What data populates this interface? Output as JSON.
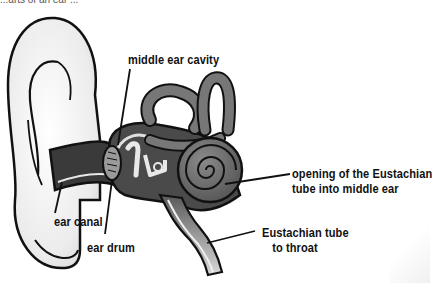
{
  "diagram": {
    "title_fragment": "...arts of an ear ...",
    "labels": [
      {
        "id": "middle-ear-cavity",
        "text": "middle ear cavity"
      },
      {
        "id": "eustachian-opening",
        "line1": "opening of the Eustachian",
        "line2": "tube into middle ear"
      },
      {
        "id": "ear-canal",
        "text": "ear canal"
      },
      {
        "id": "ear-drum",
        "text": "ear drum"
      },
      {
        "id": "eustachian-tube",
        "line1": "Eustachian tube",
        "line2": "to throat"
      }
    ],
    "colors": {
      "outline": "#111111",
      "inner_ear": "#6b6b6b",
      "canal_dark": "#3a3a3a",
      "pinna": "#f2f2f2",
      "background": "#ffffff"
    }
  }
}
